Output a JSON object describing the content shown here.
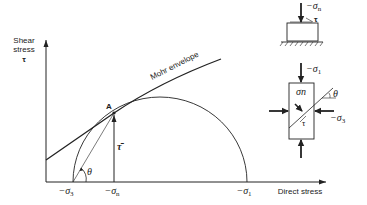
{
  "figure": {
    "type": "Mohr circle diagram",
    "y_axis": {
      "label_line1": "Shear",
      "label_line2": "stress",
      "symbol": "τ"
    },
    "x_axis": {
      "label": "Direct stress"
    },
    "ticks": [
      {
        "id": "sigma3",
        "prefix": "−σ",
        "sub": "3"
      },
      {
        "id": "sigman",
        "prefix": "−σ",
        "sub": "n"
      },
      {
        "id": "sigma1",
        "prefix": "−σ",
        "sub": "1"
      }
    ],
    "envelope_label": "Mohr envelope",
    "point_label": "A",
    "tau_bar_label": "τ̄",
    "angle_label": "θ"
  },
  "inset_block": {
    "normal_stress": {
      "prefix": "−σ",
      "sub": "n"
    },
    "shear_symbol": "τ"
  },
  "inset_element": {
    "top_stress": {
      "prefix": "−σ",
      "sub": "1"
    },
    "side_stress": {
      "prefix": "−σ",
      "sub": "3"
    },
    "angle_label": "θ",
    "plane_normal_label": "σn",
    "plane_shear_label": "τ"
  },
  "colors": {
    "ink": "#222222",
    "background": "#ffffff"
  }
}
